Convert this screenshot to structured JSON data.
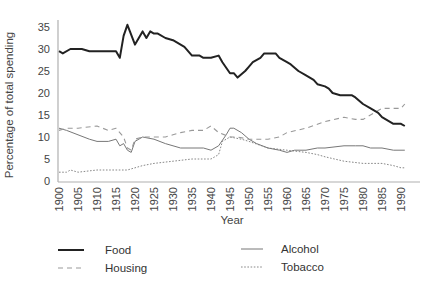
{
  "chart_data": {
    "type": "line",
    "title": "",
    "xlabel": "Year",
    "ylabel": "Percentage of total spending",
    "ylim": [
      0,
      37
    ],
    "xlim": [
      1900,
      1992
    ],
    "grid": false,
    "legend_position": "bottom",
    "y_ticks": [
      0,
      5,
      10,
      15,
      20,
      25,
      30,
      35
    ],
    "x_ticks": [
      1900,
      1905,
      1910,
      1915,
      1920,
      1925,
      1930,
      1935,
      1940,
      1945,
      1950,
      1955,
      1960,
      1965,
      1970,
      1975,
      1980,
      1985,
      1990
    ],
    "series": [
      {
        "name": "Food",
        "style": "solid-thick",
        "color": "#222222",
        "x": [
          1900,
          1901,
          1903,
          1905,
          1906,
          1908,
          1909,
          1912,
          1915,
          1916,
          1917,
          1918,
          1920,
          1922,
          1923,
          1924,
          1925,
          1926,
          1928,
          1930,
          1932,
          1933,
          1935,
          1937,
          1938,
          1940,
          1942,
          1943,
          1945,
          1946,
          1947,
          1949,
          1950,
          1951,
          1953,
          1954,
          1955,
          1957,
          1958,
          1960,
          1961,
          1963,
          1965,
          1967,
          1968,
          1970,
          1971,
          1972,
          1974,
          1975,
          1977,
          1978,
          1980,
          1982,
          1984,
          1985,
          1987,
          1988,
          1990,
          1991
        ],
        "values": [
          29.5,
          29,
          30,
          30,
          30,
          29.5,
          29.5,
          29.5,
          29.5,
          28,
          33,
          35.5,
          31,
          34,
          32.5,
          34,
          33.5,
          33.5,
          32.5,
          32,
          31,
          30.5,
          28.5,
          28.5,
          28,
          28,
          28.5,
          27,
          24.5,
          24.5,
          23.5,
          25,
          26,
          27,
          28,
          29,
          29,
          29,
          28,
          27,
          26.5,
          25,
          24,
          23,
          22,
          21.5,
          21,
          20,
          19.5,
          19.5,
          19.5,
          19,
          17.5,
          16.5,
          15.5,
          14.5,
          13.5,
          13,
          13,
          12.5
        ]
      },
      {
        "name": "Housing",
        "style": "dashed",
        "color": "#999999",
        "x": [
          1900,
          1902,
          1905,
          1910,
          1913,
          1915,
          1917,
          1918,
          1919,
          1920,
          1922,
          1925,
          1928,
          1930,
          1932,
          1935,
          1938,
          1940,
          1942,
          1945,
          1947,
          1950,
          1955,
          1958,
          1960,
          1965,
          1970,
          1975,
          1978,
          1980,
          1985,
          1988,
          1990,
          1991
        ],
        "values": [
          11.5,
          12,
          12,
          12.5,
          11.5,
          12,
          10,
          7.5,
          7,
          9.5,
          10,
          10,
          10,
          10.5,
          11,
          11.5,
          11.5,
          12.5,
          11,
          10,
          10,
          9.5,
          9.5,
          10,
          11,
          12,
          13.5,
          14.5,
          14,
          14,
          16.5,
          16.5,
          16.5,
          17.5
        ]
      },
      {
        "name": "Alcohol",
        "style": "solid-thin",
        "color": "#777777",
        "x": [
          1900,
          1902,
          1905,
          1908,
          1910,
          1913,
          1915,
          1916,
          1917,
          1918,
          1919,
          1920,
          1922,
          1925,
          1928,
          1930,
          1932,
          1935,
          1938,
          1940,
          1942,
          1944,
          1945,
          1946,
          1948,
          1950,
          1952,
          1955,
          1958,
          1960,
          1962,
          1965,
          1968,
          1970,
          1975,
          1978,
          1980,
          1982,
          1985,
          1988,
          1990,
          1991
        ],
        "values": [
          12,
          11.5,
          10.5,
          9.5,
          9,
          9,
          9.5,
          8,
          8.5,
          7,
          6.5,
          9,
          10,
          9.5,
          8.5,
          8,
          7.5,
          7.5,
          7.5,
          7,
          8,
          10.5,
          12,
          12,
          11,
          9.5,
          8.5,
          7.5,
          7,
          6.5,
          7,
          7,
          7.5,
          7.5,
          8,
          8,
          8,
          7.5,
          7.5,
          7,
          7,
          7
        ]
      },
      {
        "name": "Tobacco",
        "style": "dotted",
        "color": "#888888",
        "x": [
          1900,
          1902,
          1903,
          1905,
          1910,
          1915,
          1918,
          1920,
          1922,
          1925,
          1930,
          1935,
          1940,
          1942,
          1943,
          1945,
          1948,
          1950,
          1955,
          1960,
          1965,
          1968,
          1970,
          1975,
          1980,
          1985,
          1988,
          1990,
          1991
        ],
        "values": [
          2,
          2,
          2.5,
          2,
          2.5,
          2.5,
          2.5,
          3,
          3.5,
          4,
          4.5,
          5,
          5,
          6,
          9,
          10,
          9.5,
          9,
          7.5,
          7,
          6.5,
          6,
          5.5,
          4.5,
          4,
          4,
          3.5,
          3,
          3
        ]
      }
    ]
  }
}
